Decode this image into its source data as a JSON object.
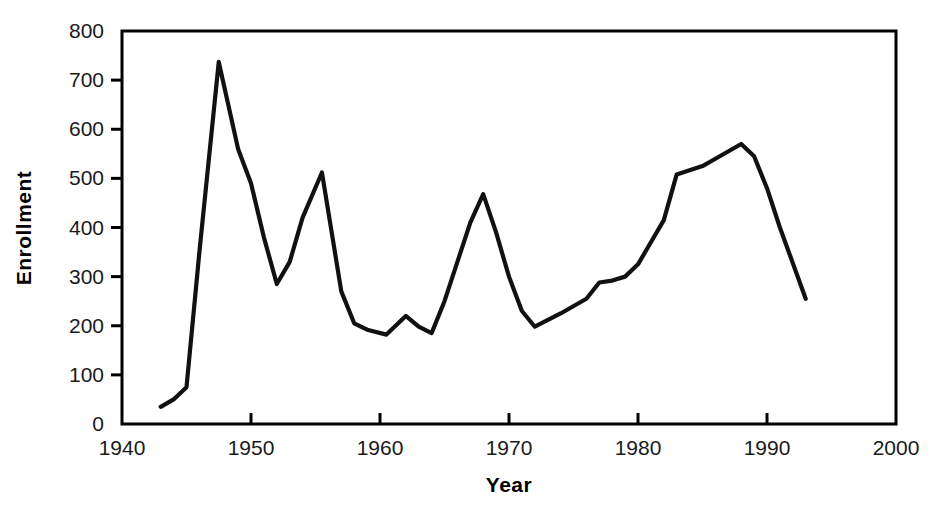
{
  "chart_data": {
    "type": "line",
    "title": "",
    "xlabel": "Year",
    "ylabel": "Enrollment",
    "xlim": [
      1940,
      2000
    ],
    "ylim": [
      0,
      800
    ],
    "xticks": [
      1940,
      1950,
      1960,
      1970,
      1980,
      1990,
      2000
    ],
    "xtick_labels": [
      "1940",
      "1950",
      "1960",
      "1970",
      "1980",
      "1990",
      "2000"
    ],
    "yticks": [
      0,
      100,
      200,
      300,
      400,
      500,
      600,
      700,
      800
    ],
    "ytick_labels": [
      "0",
      "100",
      "200",
      "300",
      "400",
      "500",
      "600",
      "700",
      "800"
    ],
    "grid": false,
    "legend": false,
    "line_color": "#111111",
    "series": [
      {
        "name": "Enrollment",
        "x": [
          1943,
          1944,
          1945,
          1946,
          1947.5,
          1949,
          1950,
          1951,
          1952,
          1953,
          1954,
          1955.5,
          1957,
          1958,
          1959,
          1960.5,
          1962,
          1963,
          1964,
          1965,
          1966,
          1967,
          1968,
          1969,
          1970,
          1971,
          1972,
          1974,
          1976,
          1977,
          1978,
          1979,
          1980,
          1981,
          1982,
          1983,
          1985,
          1986,
          1988,
          1989,
          1990,
          1991,
          1993
        ],
        "y": [
          35,
          50,
          75,
          350,
          737,
          560,
          490,
          380,
          285,
          330,
          420,
          512,
          270,
          205,
          192,
          182,
          220,
          198,
          185,
          250,
          330,
          410,
          468,
          390,
          300,
          230,
          198,
          225,
          255,
          288,
          292,
          300,
          325,
          370,
          415,
          508,
          525,
          540,
          570,
          545,
          480,
          400,
          255
        ]
      }
    ]
  },
  "axis_titles": {
    "x": "Year",
    "y": "Enrollment"
  }
}
